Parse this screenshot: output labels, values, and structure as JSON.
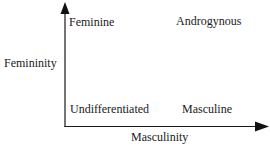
{
  "diagram": {
    "type": "quadrant",
    "axes": {
      "y_label": "Femininity",
      "x_label": "Masculinity"
    },
    "quadrants": {
      "top_left": "Feminine",
      "top_right": "Androgynous",
      "bottom_left": "Undifferentiated",
      "bottom_right": "Masculine"
    },
    "colors": {
      "line": "#1a1a1a",
      "background": "#ffffff"
    }
  }
}
